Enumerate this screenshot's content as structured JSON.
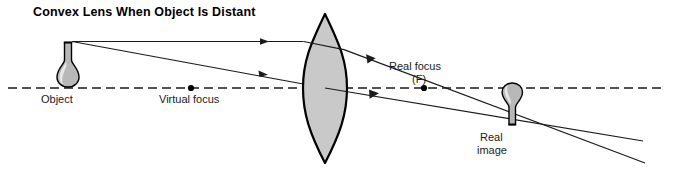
{
  "title": "Convex Lens When Object Is Distant",
  "labels": {
    "object": "Object",
    "virtual_focus": "Virtual focus",
    "real_focus": "Real focus",
    "real_focus_symbol": "(F)",
    "real_image_line1": "Real",
    "real_image_line2": "image"
  },
  "colors": {
    "ink": "#1a1a1a",
    "lens_fill": "#c9c9c9",
    "flask_fill": "#b8b8b8",
    "background": "#ffffff"
  },
  "geometry": {
    "axis_y": 88,
    "axis_x_start": 8,
    "axis_x_end": 662,
    "lens_center_x": 325,
    "lens_top_y": 14,
    "lens_bottom_y": 163,
    "lens_half_width": 22,
    "object_x": 68,
    "object_top_y": 41,
    "virtual_focus_x": 191,
    "real_focus_x": 424,
    "image_x": 512,
    "image_bottom_y": 125
  }
}
